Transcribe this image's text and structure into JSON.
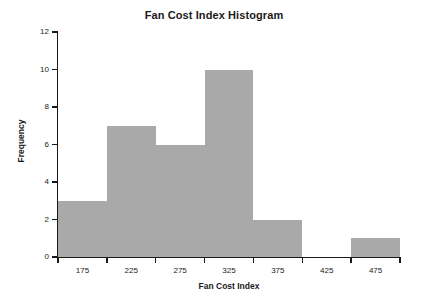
{
  "chart_data": {
    "type": "bar",
    "title": "Fan Cost Index Histogram",
    "xlabel": "Fan Cost Index",
    "ylabel": "Frequency",
    "categories": [
      "175",
      "225",
      "275",
      "325",
      "375",
      "425",
      "475"
    ],
    "values": [
      3,
      7,
      6,
      10,
      2,
      0,
      1
    ],
    "bin_edges": [
      150,
      200,
      250,
      300,
      350,
      400,
      450,
      500
    ],
    "bin_width": 50,
    "xlim": [
      150,
      500
    ],
    "ylim": [
      0,
      12
    ],
    "x_tick_values": [
      150,
      200,
      250,
      300,
      350,
      400,
      450,
      500
    ],
    "y_tick_labels": [
      "0",
      "2",
      "4",
      "6",
      "8",
      "10",
      "12"
    ],
    "y_tick_values": [
      0,
      2,
      4,
      6,
      8,
      10,
      12
    ],
    "grid": false,
    "legend": false,
    "bar_color": "#a9a9a9",
    "axis_color": "#1a1a1a"
  }
}
